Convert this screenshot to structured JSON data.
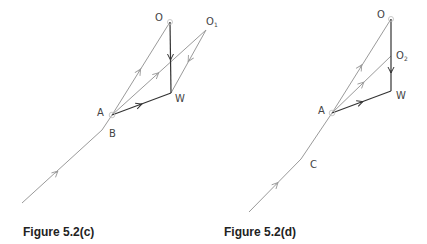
{
  "figures": [
    {
      "caption": "Figure 5.2(c)",
      "labels": {
        "O": "O",
        "O1": "O",
        "O1_sub": "1",
        "W": "W",
        "A": "A",
        "B": "B"
      }
    },
    {
      "caption": "Figure 5.2(d)",
      "labels": {
        "O": "O",
        "O2": "O",
        "O2_sub": "2",
        "W": "W",
        "A": "A",
        "C": "C"
      }
    }
  ],
  "colors": {
    "light_line": "#9a9a9a",
    "dark_line": "#333333",
    "label": "#444444"
  }
}
